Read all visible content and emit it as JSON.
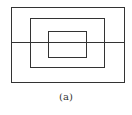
{
  "figure": {
    "caption": "(a)",
    "stroke_color": "#333333",
    "rectangles": [
      {
        "name": "outer",
        "x": 11,
        "y": 7,
        "w": 113,
        "h": 75
      },
      {
        "name": "middle",
        "x": 30,
        "y": 18,
        "w": 74,
        "h": 49
      },
      {
        "name": "inner",
        "x": 48,
        "y": 31,
        "w": 38,
        "h": 26
      }
    ],
    "horizontal_line": {
      "x1": 11,
      "x2": 124,
      "y": 42
    }
  }
}
